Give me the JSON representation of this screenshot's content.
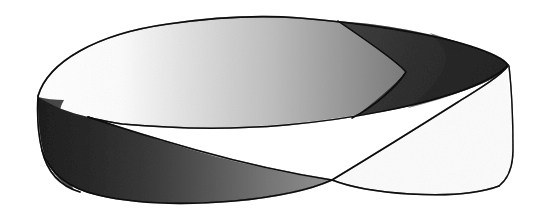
{
  "figure": {
    "name": "mobius-strip-illustration",
    "medium": "scanned halftone print illustration",
    "caption": "",
    "background_color": "#ffffff",
    "outline_color": "#3a3a3a",
    "canvas": {
      "width": 547,
      "height": 219
    },
    "colors": {
      "paper_white": "#ffffff",
      "near_white": "#fbfbfb",
      "light_gray": "#d8d8d8",
      "mid_gray": "#a8a8a8",
      "dark_gray": "#6e6e6e",
      "darkest_gray": "#5a5a5a",
      "outline": "#3a3a3a"
    },
    "regions": [
      {
        "name": "top-band-far-side",
        "label": "Far half of band seen from above",
        "shading": "gradient from white at left to mid gray at right",
        "gradient_from": "#ffffff",
        "gradient_to": "#9a9a9a"
      },
      {
        "name": "right-end-cap",
        "label": "Right end of band curving away, darkest tone",
        "shading": "uniform dark gray",
        "fill": "#6e6e6e"
      },
      {
        "name": "front-band-left",
        "label": "Near half of band, front face",
        "shading": "gradient from darkest gray at left to light gray toward the crossing",
        "gradient_from": "#5f5f5f",
        "gradient_to": "#c9c9c9"
      },
      {
        "name": "front-band-right",
        "label": "Twisted portion right of the crossing, reverse face",
        "shading": "white / near white",
        "fill": "#fdfdfd"
      },
      {
        "name": "left-end-cap",
        "label": "Left end of band curving away, white upper region",
        "shading": "white",
        "fill": "#ffffff"
      }
    ],
    "key_points": {
      "crossing_point": {
        "x": 332,
        "y": 180,
        "label": "self-crossing of silhouette edges"
      },
      "left_cusp": {
        "x": 90,
        "y": 118,
        "label": "edge tangency at left"
      },
      "top_apex": {
        "x": 285,
        "y": 17,
        "label": "highest point of upper outline"
      },
      "left_edge_x": 37,
      "right_edge_x": 513,
      "bottom_y": 203
    },
    "geometry": {
      "twists": 1,
      "sides": 1,
      "edges": 1,
      "euler_characteristic": 0,
      "orientable": false
    }
  }
}
